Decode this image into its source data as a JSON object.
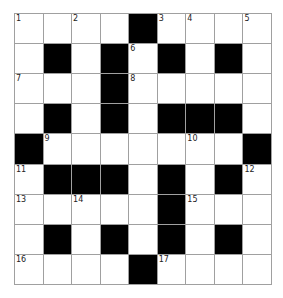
{
  "puzzle": {
    "rows": 9,
    "cols": 9,
    "layout": [
      "....#....",
      ".#.#.#.#.",
      "...#.....",
      ".#.#.###.",
      "#.......#",
      ".###.#.#.",
      ".....#...",
      ".#.#.#.#.",
      "....#...."
    ],
    "numbers": {
      "0,0": "1",
      "0,2": "2",
      "0,5": "3",
      "0,6": "4",
      "0,8": "5",
      "1,4": "6",
      "2,0": "7",
      "2,4": "8",
      "4,1": "9",
      "4,6": "10",
      "5,0": "11",
      "5,8": "12",
      "6,0": "13",
      "6,2": "14",
      "6,6": "15",
      "8,0": "16",
      "8,5": "17"
    }
  },
  "colors": {
    "block": "#000000",
    "cell": "#ffffff",
    "grid_line": "#a0a0a0"
  }
}
